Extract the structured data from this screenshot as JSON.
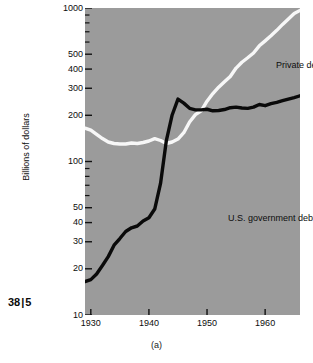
{
  "page_marker": {
    "left": "38",
    "separator": "|",
    "right": "5"
  },
  "caption": "(a)",
  "chart_data": {
    "type": "line",
    "title": "",
    "subtitle": "",
    "xlabel": "",
    "ylabel": "Billions of dollars",
    "yscale": "log",
    "xscale": "linear",
    "ylim": [
      10,
      1000
    ],
    "xlim": [
      1929,
      1966
    ],
    "grid": false,
    "legend_position": "inline-annotations",
    "plot_background": "#9b9b9b",
    "y_ticks": [
      10,
      20,
      30,
      40,
      50,
      100,
      200,
      300,
      400,
      500,
      1000
    ],
    "y_tick_labels": [
      "10",
      "20",
      "30",
      "40",
      "50",
      "100",
      "200",
      "300",
      "400",
      "500",
      "1000"
    ],
    "y_minor_ticks": [
      60,
      70,
      80,
      90,
      600,
      700,
      800,
      900
    ],
    "x_ticks": [
      1930,
      1940,
      1950,
      1960
    ],
    "x_tick_labels": [
      "1930",
      "1940",
      "1950",
      "1960"
    ],
    "series": [
      {
        "name": "U.S. government debt",
        "color": "#0a0a0a",
        "label_position": {
          "x": 1948,
          "y": 62
        },
        "x": [
          1929,
          1930,
          1931,
          1932,
          1933,
          1934,
          1935,
          1936,
          1937,
          1938,
          1939,
          1940,
          1941,
          1942,
          1943,
          1944,
          1945,
          1946,
          1947,
          1948,
          1949,
          1950,
          1951,
          1952,
          1953,
          1954,
          1955,
          1956,
          1957,
          1958,
          1959,
          1960,
          1961,
          1962,
          1963,
          1964,
          1965,
          1966
        ],
        "values": [
          16.5,
          17.0,
          18.5,
          21.0,
          24.0,
          28.5,
          31.5,
          35.0,
          37.0,
          38.0,
          41.0,
          43.0,
          49.0,
          72.0,
          137.0,
          201.0,
          255.0,
          240.0,
          222.0,
          217.0,
          217.0,
          219.0,
          214.0,
          215.0,
          218.0,
          224.0,
          226.0,
          223.0,
          222.0,
          226.0,
          235.0,
          231.0,
          238.0,
          243.0,
          249.0,
          255.0,
          261.0,
          268.0
        ]
      },
      {
        "name": "Private debt",
        "color": "#f7f7f7",
        "label_position": {
          "x": 1952,
          "y": 430
        },
        "x": [
          1929,
          1930,
          1931,
          1932,
          1933,
          1934,
          1935,
          1936,
          1937,
          1938,
          1939,
          1940,
          1941,
          1942,
          1943,
          1944,
          1945,
          1946,
          1947,
          1948,
          1949,
          1950,
          1951,
          1952,
          1953,
          1954,
          1955,
          1956,
          1957,
          1958,
          1959,
          1960,
          1961,
          1962,
          1963,
          1964,
          1965,
          1966
        ],
        "values": [
          165.0,
          160.0,
          150.0,
          141.0,
          134.0,
          131.0,
          130.0,
          130.0,
          132.0,
          131.0,
          133.0,
          136.0,
          141.0,
          137.0,
          131.0,
          134.0,
          140.0,
          154.0,
          181.0,
          202.0,
          214.0,
          247.0,
          277.0,
          305.0,
          331.0,
          358.0,
          406.0,
          443.0,
          474.0,
          509.0,
          567.0,
          611.0,
          659.0,
          715.0,
          782.0,
          849.0,
          920.0,
          965.0
        ]
      }
    ],
    "annotations": [
      {
        "text": "Private debt",
        "name": "private-debt-label"
      },
      {
        "text": "U.S. government debt",
        "name": "government-debt-label"
      }
    ]
  }
}
